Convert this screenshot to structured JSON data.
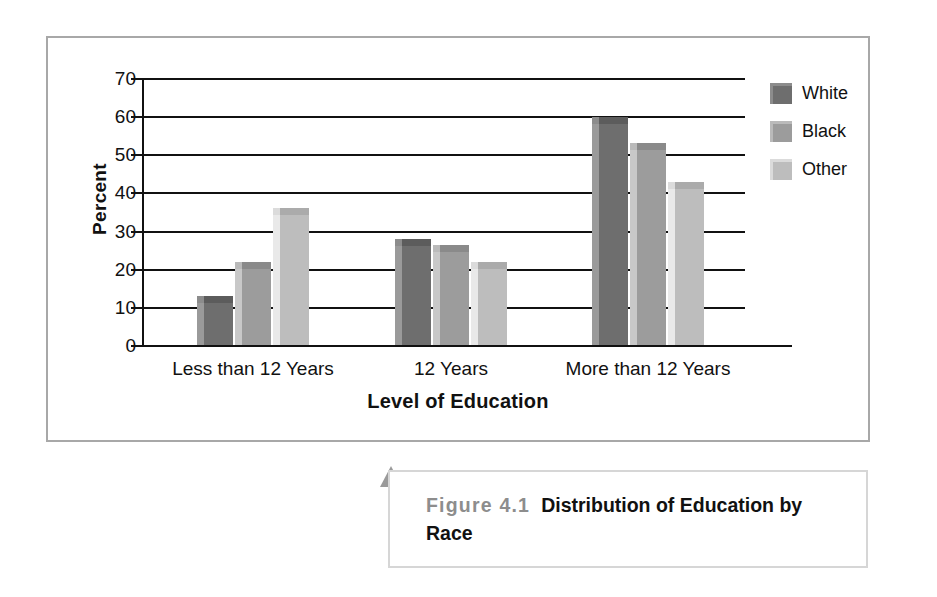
{
  "figure": {
    "caption_number": "Figure 4.1",
    "caption_title": "Distribution of Education by Race",
    "number_color": "#8d8d8d",
    "title_color": "#111111",
    "frame_border_color": "#a8a8a8",
    "caption_border_color": "#d6d6d6",
    "arrow_color": "#9a9a9a",
    "arrow_name": "up-arrow-pointer"
  },
  "chart_data": {
    "type": "bar",
    "title": "",
    "subtitle": "",
    "xlabel": "Level of Education",
    "ylabel": "Percent",
    "categories": [
      "Less than 12 Years",
      "12 Years",
      "More than 12 Years"
    ],
    "series": [
      {
        "name": "White",
        "values": [
          11,
          26,
          58
        ],
        "color": "#6e6e6e"
      },
      {
        "name": "Black",
        "values": [
          20,
          24.5,
          51
        ],
        "color": "#9c9c9c"
      },
      {
        "name": "Other",
        "values": [
          34,
          20,
          41
        ],
        "color": "#bdbdbd"
      }
    ],
    "ylim": [
      0,
      70
    ],
    "yticks": [
      0,
      10,
      20,
      30,
      40,
      50,
      60,
      70
    ],
    "ytick_labels": [
      "0",
      "10",
      "20",
      "30",
      "40",
      "50",
      "60",
      "70"
    ],
    "grid": true,
    "grid_axis": "y",
    "grid_color": "#111111",
    "legend": true,
    "legend_position": "right-top",
    "legend_entries": [
      "White",
      "Black",
      "Other"
    ],
    "bar_style": "3d-extruded",
    "axis_color": "#111111",
    "background": "#ffffff"
  }
}
